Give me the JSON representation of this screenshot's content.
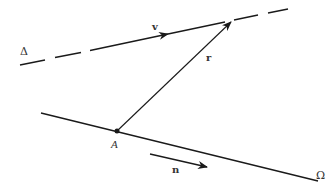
{
  "diagram": {
    "labels": {
      "line_delta": "Δ",
      "line_omega": "Ω",
      "vector_v": "v",
      "vector_r": "r",
      "vector_n": "n",
      "point_a": "A"
    },
    "colors": {
      "stroke": "#1a1a1a",
      "text": "#333333",
      "background": "#ffffff"
    },
    "elements": {
      "line_delta": {
        "style": "dashed",
        "from": [
          20,
          65
        ],
        "to": [
          288,
          9
        ]
      },
      "line_omega": {
        "style": "solid",
        "from": [
          41,
          113
        ],
        "to": [
          318,
          181
        ]
      },
      "vector_r": {
        "from": [
          117,
          131
        ],
        "to": [
          231,
          22
        ]
      },
      "vector_v": {
        "on": "line_delta",
        "head": [
          168,
          34
        ]
      },
      "vector_n": {
        "from": [
          150,
          154
        ],
        "to": [
          207,
          167
        ]
      },
      "point_a": {
        "at": [
          117,
          131
        ]
      }
    }
  }
}
